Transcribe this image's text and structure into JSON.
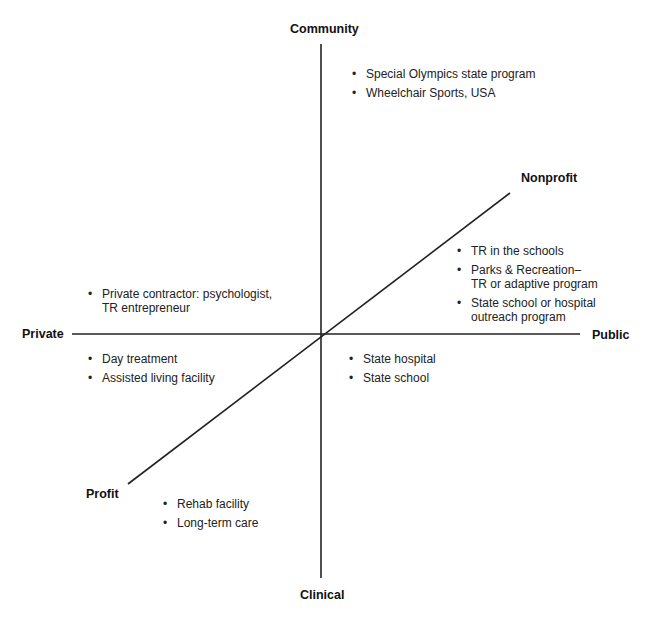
{
  "diagram": {
    "type": "three-axis classification diagram",
    "axes": {
      "vertical": {
        "top": "Community",
        "bottom": "Clinical"
      },
      "horizontal": {
        "left": "Private",
        "right": "Public"
      },
      "diagonal": {
        "upper_right": "Nonprofit",
        "lower_left": "Profit"
      }
    },
    "groups": {
      "community_top": {
        "items": [
          {
            "lines": [
              "Special Olympics state program"
            ]
          },
          {
            "lines": [
              "Wheelchair Sports, USA"
            ]
          }
        ]
      },
      "public_nonprofit": {
        "items": [
          {
            "lines": [
              "TR in the schools"
            ]
          },
          {
            "lines": [
              "Parks & Recreation–",
              "TR or adaptive program"
            ]
          },
          {
            "lines": [
              "State school or hospital",
              "outreach program"
            ]
          }
        ]
      },
      "private_upper": {
        "items": [
          {
            "lines": [
              "Private contractor: psychologist,",
              "TR entrepreneur"
            ]
          }
        ]
      },
      "private_lower": {
        "items": [
          {
            "lines": [
              "Day treatment"
            ]
          },
          {
            "lines": [
              "Assisted living facility"
            ]
          }
        ]
      },
      "public_lower": {
        "items": [
          {
            "lines": [
              "State hospital"
            ]
          },
          {
            "lines": [
              "State school"
            ]
          }
        ]
      },
      "profit_lower": {
        "items": [
          {
            "lines": [
              "Rehab facility"
            ]
          },
          {
            "lines": [
              "Long-term care"
            ]
          }
        ]
      }
    },
    "bullet_glyph": "•",
    "colors": {
      "line": "#222222",
      "text": "#222222",
      "background": "#ffffff"
    }
  }
}
